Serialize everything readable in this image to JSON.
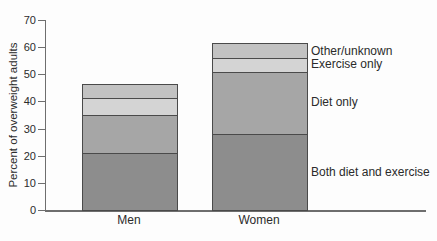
{
  "chart_data": {
    "type": "bar",
    "stacked": true,
    "title": "",
    "xlabel": "",
    "ylabel": "Percent of overweight adults",
    "categories": [
      "Men",
      "Women"
    ],
    "series": [
      {
        "name": "Both diet and exercise",
        "values": [
          21,
          28
        ],
        "color": "#8d8d8d"
      },
      {
        "name": "Diet only",
        "values": [
          14,
          23
        ],
        "color": "#a6a6a6"
      },
      {
        "name": "Exercise only",
        "values": [
          6,
          5
        ],
        "color": "#d4d4d4"
      },
      {
        "name": "Other/unknown",
        "values": [
          5,
          5
        ],
        "color": "#c2c2c2"
      }
    ],
    "ylim": [
      0,
      70
    ],
    "y_ticks": [
      0,
      10,
      20,
      30,
      40,
      50,
      60,
      70
    ],
    "grid": false,
    "legend_position": "labels-right-of-women-bar",
    "axis_color": "#6e6e6e",
    "segment_border_color": "#4a4a4a"
  }
}
